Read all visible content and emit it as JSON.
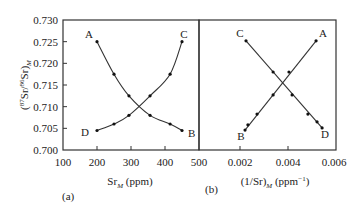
{
  "figure": {
    "ylabel": "(87Sr/86Sr)M",
    "panel_a_label": "(a)",
    "panel_b_label": "(b)"
  },
  "chart_data": [
    {
      "type": "line",
      "panel": "(a)",
      "title": "",
      "xlabel": "Sr_M (ppm)",
      "ylabel": "(87Sr/86Sr)_M",
      "xlim": [
        100,
        500
      ],
      "ylim": [
        0.7,
        0.73
      ],
      "xticks": [
        100,
        200,
        300,
        400,
        500
      ],
      "xtick_labels": [
        "100",
        "200",
        "300",
        "400",
        "500"
      ],
      "yticks": [
        0.7,
        0.705,
        0.71,
        0.715,
        0.72,
        0.725,
        0.73
      ],
      "ytick_labels": [
        "0.700",
        "0.705",
        "0.710",
        "0.715",
        "0.720",
        "0.725",
        "0.730"
      ],
      "grid": false,
      "series": [
        {
          "name": "A-B",
          "start_label": "A",
          "end_label": "B",
          "x": [
            200,
            250,
            294,
            356,
            415,
            450
          ],
          "y": [
            0.725,
            0.7175,
            0.7125,
            0.708,
            0.706,
            0.7045
          ]
        },
        {
          "name": "D-C",
          "start_label": "D",
          "end_label": "C",
          "x": [
            200,
            250,
            294,
            356,
            415,
            450
          ],
          "y": [
            0.7045,
            0.706,
            0.708,
            0.7125,
            0.7175,
            0.725
          ]
        }
      ]
    },
    {
      "type": "line",
      "panel": "(b)",
      "title": "",
      "xlabel": "(1/Sr)_M (ppm^-1)",
      "ylabel": "(87Sr/86Sr)_M",
      "xlim": [
        0.0,
        0.006
      ],
      "ylim": [
        0.7,
        0.73
      ],
      "xticks": [
        0.002,
        0.004,
        0.006
      ],
      "xtick_labels": [
        "0.002",
        "0.004",
        "0.006"
      ],
      "grid": false,
      "series": [
        {
          "name": "B-A",
          "start_label": "B",
          "end_label": "A",
          "x": [
            0.00221,
            0.00233,
            0.00271,
            0.00338,
            0.00404,
            0.00517
          ],
          "y": [
            0.7046,
            0.7058,
            0.7083,
            0.7127,
            0.718,
            0.7252
          ]
        },
        {
          "name": "C-D",
          "start_label": "C",
          "end_label": "D",
          "x": [
            0.00225,
            0.00338,
            0.00417,
            0.00483,
            0.00521,
            0.00542
          ],
          "y": [
            0.7252,
            0.718,
            0.7127,
            0.7083,
            0.7065,
            0.7051
          ]
        }
      ]
    }
  ]
}
